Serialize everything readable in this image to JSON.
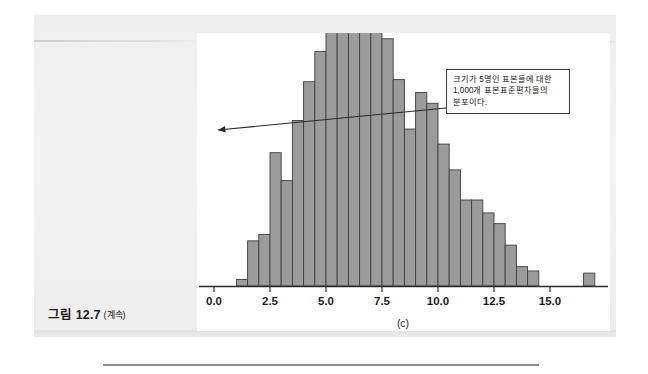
{
  "page": {
    "background_color": "#f1f1f1",
    "plate_color": "#ffffff"
  },
  "caption": {
    "label": "그림 12.7",
    "continued": "(계속)"
  },
  "callout": {
    "name": "annotation-callout",
    "lines": [
      "크기가 5명인 표본들에 대한",
      "1,000개  표본표준편차들의",
      "분포이다."
    ],
    "border_color": "#3a3a3a",
    "arrow_from": [
      446,
      108
    ],
    "arrow_to": [
      213,
      134
    ]
  },
  "chart_data": {
    "type": "bar",
    "subtype": "histogram",
    "title": "",
    "subtitle": "",
    "panel_label": "(c)",
    "xlabel": "",
    "ylabel": "",
    "grid": false,
    "legend": null,
    "bar_color": "#9b9b9b",
    "bar_edge_color": "#3f3f3f",
    "axis_color": "#2b2b2b",
    "xlim": [
      -0.8,
      17.6
    ],
    "ylim": [
      0,
      100
    ],
    "bin_width": 0.5,
    "xticks": [
      0.0,
      2.5,
      5.0,
      7.5,
      10.0,
      12.5,
      15.0
    ],
    "xtick_labels": [
      "0.0",
      "2.5",
      "5.0",
      "7.5",
      "10.0",
      "12.5",
      "15.0"
    ],
    "bin_starts": [
      1.0,
      1.5,
      2.0,
      2.5,
      3.0,
      3.5,
      4.0,
      4.5,
      5.0,
      5.5,
      6.0,
      6.5,
      7.0,
      7.5,
      8.0,
      8.5,
      9.0,
      9.5,
      10.0,
      10.5,
      11.0,
      11.5,
      12.0,
      12.5,
      13.0,
      13.5,
      14.0,
      16.5
    ],
    "values": [
      3,
      21,
      24,
      62,
      49,
      77,
      95,
      109,
      130,
      127,
      118,
      131,
      135,
      115,
      96,
      73,
      90,
      85,
      66,
      54,
      40,
      40,
      34,
      29,
      19,
      9,
      7,
      6
    ],
    "annotations": [
      {
        "text": "크기가 5명인 표본들에 대한 1,000개 표본표준편차들의 분포이다.",
        "x": 1.0,
        "y": 74
      }
    ]
  }
}
